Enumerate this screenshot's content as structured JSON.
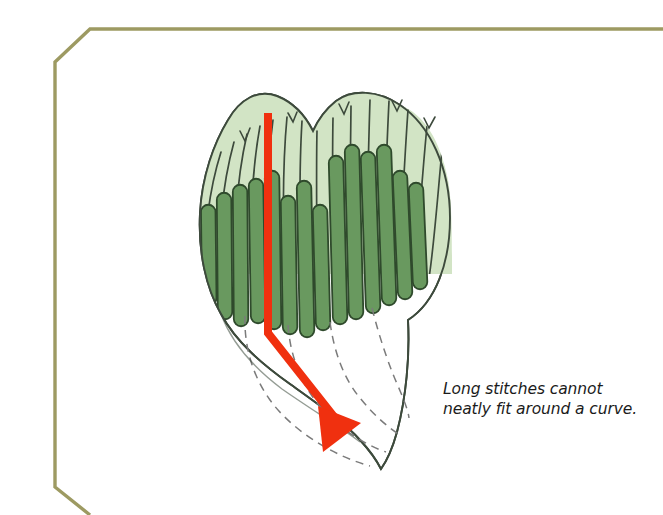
{
  "figure": {
    "title": "Long stitches cannot neatly fit around a curve",
    "type": "embroidery-satin-stitch-illustration",
    "caption": {
      "line1": "Long stitches cannot",
      "line2": "neatly fit around a curve."
    },
    "colors": {
      "page_background": "#ffffff",
      "border_rule": "#9d9a62",
      "outline": "#3d4a3c",
      "stitch_light": "#d2e4c5",
      "stitch_dark": "#69995f",
      "stitch_dark_edge": "#2f4a2c",
      "arrow_red": "#f0300f",
      "dashed_guide": "#7b7b7b",
      "caption_text": "#1b1b1b"
    },
    "elements": {
      "border_name": "beveled-corner-rule",
      "shape_name": "curved-leaf-shape",
      "light_stitch_count": 14,
      "dark_stitch_count": 13,
      "dashed_guide_count": 4,
      "arrow_name": "red-stitch-direction-arrow"
    }
  }
}
